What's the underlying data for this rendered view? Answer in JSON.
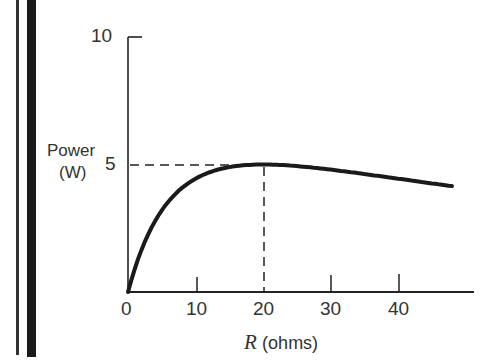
{
  "chart_data": {
    "type": "line",
    "title": "",
    "xlabel": "R (ohms)",
    "xlabel_var": "R",
    "xlabel_unit": "(ohms)",
    "ylabel": "Power (W)",
    "ylabel_line1": "Power",
    "ylabel_line2": "(W)",
    "xlim": [
      0,
      48
    ],
    "ylim": [
      0,
      10
    ],
    "x_ticks": [
      "0",
      "10",
      "20",
      "30",
      "40"
    ],
    "y_ticks": [
      "5",
      "10"
    ],
    "grid": false,
    "series": [
      {
        "name": "Power vs R",
        "x": [
          0,
          2,
          5,
          10,
          15,
          20,
          25,
          30,
          35,
          40,
          45,
          48
        ],
        "values": [
          0,
          1.65,
          3.2,
          4.44,
          4.9,
          5.0,
          4.94,
          4.8,
          4.63,
          4.44,
          4.26,
          4.1
        ]
      }
    ],
    "annotations": [
      {
        "type": "dashed-hline",
        "y": 5,
        "x_to": 20
      },
      {
        "type": "dashed-vline",
        "x": 20,
        "y_to": 5
      }
    ]
  }
}
